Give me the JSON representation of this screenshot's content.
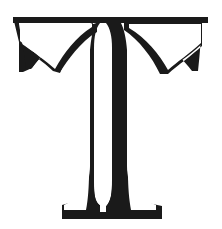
{
  "canvas": {
    "width": 222,
    "height": 229,
    "background_color": "#ffffff"
  },
  "artwork": {
    "kind": "decorative-initial",
    "character": "T",
    "letterform_style": "inline bracketed serif capital",
    "ink_color": "#1a1a1a",
    "paper_color": "#ffffff",
    "description": "Large ornamental serif capital letter T",
    "alt_text": "Decorative capital letter T"
  },
  "glyph_parts": {
    "top_bar": {
      "name": "top-bar",
      "left_x": 13,
      "right_x": 208,
      "top_y": 17,
      "thickness": 6
    },
    "left_arm": {
      "name": "left-arm-terminal",
      "outer_x": 13,
      "tip_y": 72,
      "edge_thickness": 5
    },
    "right_arm": {
      "name": "right-arm-terminal",
      "outer_x": 208,
      "tip_y": 72,
      "edge_thickness": 8
    },
    "stem": {
      "name": "split-stem",
      "thin_stroke_left_x": 89,
      "thin_stroke_width": 4,
      "inline_gap_width": 12,
      "thick_stroke_left_x": 105,
      "thick_stroke_width": 14,
      "top_y": 24,
      "bottom_y": 190
    },
    "foot": {
      "name": "bracketed-foot",
      "left_x": 62,
      "right_x": 162,
      "baseline_y": 219,
      "slab_thickness": 7
    },
    "brackets": {
      "name": "curved-bracket-swashes",
      "count": 2,
      "shape": "concave sweep from arm terminal up to stem shoulder"
    }
  }
}
